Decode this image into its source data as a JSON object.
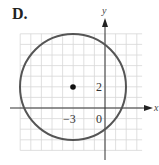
{
  "panel_label": "D.",
  "chart_data": {
    "type": "scatter",
    "title": "",
    "xlabel": "x",
    "ylabel": "y",
    "xlim": [
      -8,
      3
    ],
    "ylim": [
      -4,
      7
    ],
    "grid": true,
    "center": {
      "x": -3,
      "y": 2
    },
    "radius": 5,
    "tick_labels": {
      "x": [
        "-3",
        "0"
      ],
      "y": [
        "2"
      ]
    },
    "points": [
      {
        "x": -3,
        "y": 2,
        "label": "center"
      }
    ]
  },
  "labels": {
    "x_tick": "−3",
    "origin": "0",
    "y_tick": "2",
    "x_axis": "x",
    "y_axis": "y"
  },
  "colors": {
    "circle": "#555555",
    "grid": "#d8d8d8",
    "axis": "#333333"
  }
}
